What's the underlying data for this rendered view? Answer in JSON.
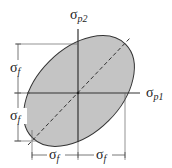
{
  "diagram": {
    "axes": {
      "vertical_label": "σ",
      "vertical_sub": "p2",
      "horizontal_label": "σ",
      "horizontal_sub": "p1"
    },
    "dimensions": {
      "left_upper": {
        "symbol": "σ",
        "sub": "f"
      },
      "left_lower": {
        "symbol": "σ",
        "sub": "f"
      },
      "bottom_left": {
        "symbol": "σ",
        "sub": "f"
      },
      "bottom_right": {
        "symbol": "σ",
        "sub": "f"
      }
    },
    "colors": {
      "ellipse_fill": "#c4c4c4",
      "lines": "#333333",
      "dimension_lines": "#555555"
    }
  }
}
